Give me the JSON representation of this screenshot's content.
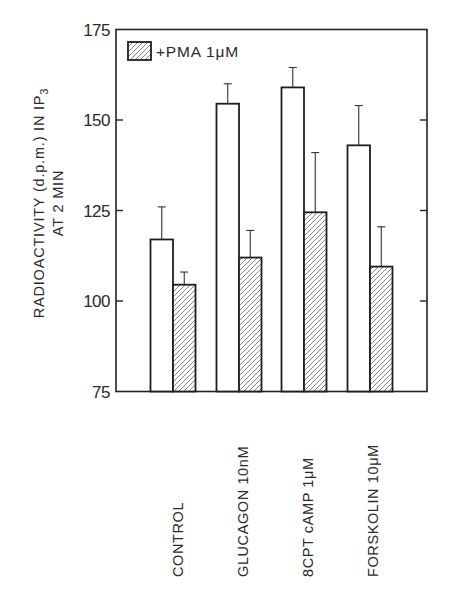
{
  "chart_data": {
    "type": "bar",
    "title": "",
    "xlabel": "",
    "ylabel": "RADIOACTIVITY (d.p.m.) IN IP3 AT 2 MIN",
    "ylabel_lines": [
      "RADIOACTIVITY (d.p.m.) IN IP",
      "3",
      "AT 2 MIN"
    ],
    "ylim": [
      75,
      175
    ],
    "yticks": [
      75,
      100,
      125,
      150,
      175
    ],
    "ytick_labels": [
      "75",
      "100",
      "125",
      "150",
      "175"
    ],
    "grid": false,
    "legend_position": "top-left inside",
    "categories": [
      "CONTROL",
      "GLUCAGON 10nM",
      "8CPT cAMP  1μM",
      "FORSKOLIN 10μM"
    ],
    "series": [
      {
        "name": "Control (no PMA)",
        "style": "open",
        "values": [
          117,
          154.5,
          159,
          143
        ],
        "error_upper": [
          126,
          160,
          164.5,
          154
        ]
      },
      {
        "name": "+PMA 1μM",
        "style": "hatched",
        "values": [
          104.5,
          112,
          124.5,
          109.5
        ],
        "error_upper": [
          108,
          119.5,
          141,
          120.5
        ]
      }
    ],
    "legend": [
      {
        "label": "+PMA 1μM",
        "style": "hatched"
      }
    ]
  },
  "colors": {
    "ink": "#1e1e1e",
    "hatch": "#555555",
    "background": "#ffffff"
  }
}
